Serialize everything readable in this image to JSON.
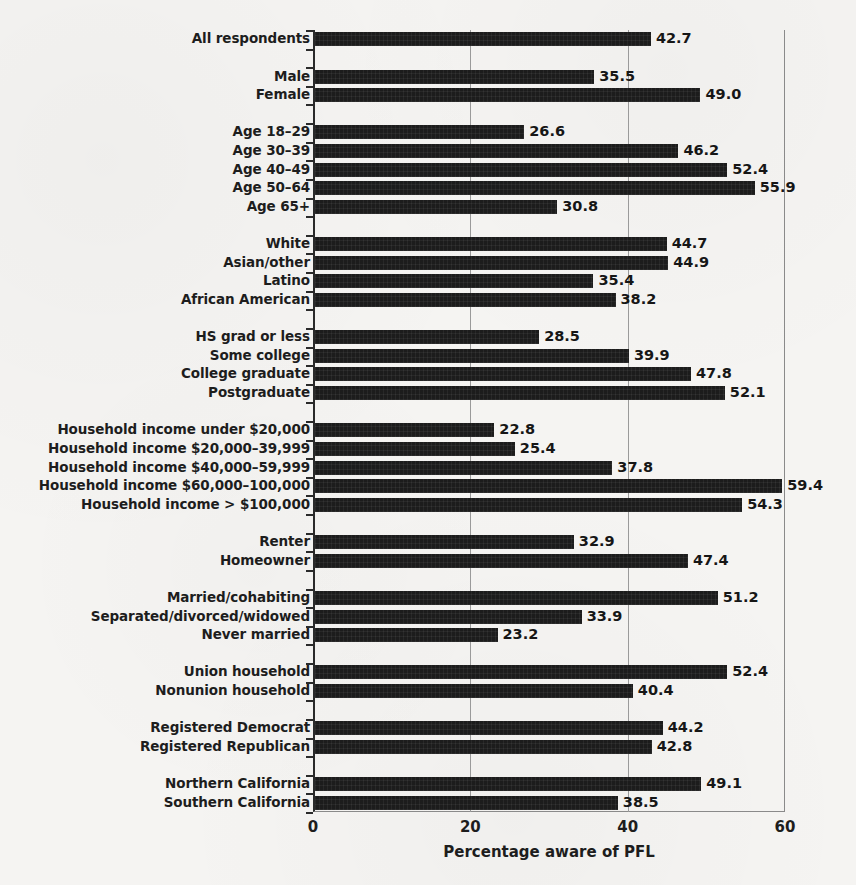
{
  "chart_data": {
    "type": "bar",
    "orientation": "horizontal",
    "title": "",
    "xlabel": "Percentage aware of PFL",
    "ylabel": "",
    "xlim": [
      0,
      60
    ],
    "xticks": [
      0,
      20,
      40,
      60
    ],
    "xtick_labels": [
      "0",
      "20",
      "40",
      "60"
    ],
    "grid": "vertical gridlines at 20 and 40",
    "legend": "none",
    "bar_color": "#1c1c1c",
    "background_color": "#f5f4f2",
    "value_label_format": "one decimal place, placed at right end of each bar",
    "categories": [
      "All respondents",
      "Male",
      "Female",
      "Age 18–29",
      "Age 30–39",
      "Age 40–49",
      "Age 50–64",
      "Age 65+",
      "White",
      "Asian/other",
      "Latino",
      "African American",
      "HS grad or less",
      "Some college",
      "College graduate",
      "Postgraduate",
      "Household income under $20,000",
      "Household income $20,000–39,999",
      "Household income $40,000–59,999",
      "Household income $60,000–100,000",
      "Household income > $100,000",
      "Renter",
      "Homeowner",
      "Married/cohabiting",
      "Separated/divorced/widowed",
      "Never married",
      "Union household",
      "Nonunion household",
      "Registered Democrat",
      "Registered Republican",
      "Northern California",
      "Southern California"
    ],
    "values": [
      42.7,
      35.5,
      49.0,
      26.6,
      46.2,
      52.4,
      55.9,
      30.8,
      44.7,
      44.9,
      35.4,
      38.2,
      28.5,
      39.9,
      47.8,
      52.1,
      22.8,
      25.4,
      37.8,
      59.4,
      54.3,
      32.9,
      47.4,
      51.2,
      33.9,
      23.2,
      52.4,
      40.4,
      44.2,
      42.8,
      49.1,
      38.5
    ],
    "groups": [
      {
        "name": "overall",
        "categories": [
          "All respondents"
        ]
      },
      {
        "name": "gender",
        "categories": [
          "Male",
          "Female"
        ]
      },
      {
        "name": "age",
        "categories": [
          "Age 18–29",
          "Age 30–39",
          "Age 40–49",
          "Age 50–64",
          "Age 65+"
        ]
      },
      {
        "name": "race-ethnicity",
        "categories": [
          "White",
          "Asian/other",
          "Latino",
          "African American"
        ]
      },
      {
        "name": "education",
        "categories": [
          "HS grad or less",
          "Some college",
          "College graduate",
          "Postgraduate"
        ]
      },
      {
        "name": "household-income",
        "categories": [
          "Household income under $20,000",
          "Household income $20,000–39,999",
          "Household income $40,000–59,999",
          "Household income $60,000–100,000",
          "Household income > $100,000"
        ]
      },
      {
        "name": "housing",
        "categories": [
          "Renter",
          "Homeowner"
        ]
      },
      {
        "name": "marital-status",
        "categories": [
          "Married/cohabiting",
          "Separated/divorced/widowed",
          "Never married"
        ]
      },
      {
        "name": "union",
        "categories": [
          "Union household",
          "Nonunion household"
        ]
      },
      {
        "name": "party",
        "categories": [
          "Registered Democrat",
          "Registered Republican"
        ]
      },
      {
        "name": "region",
        "categories": [
          "Northern California",
          "Southern California"
        ]
      }
    ]
  }
}
